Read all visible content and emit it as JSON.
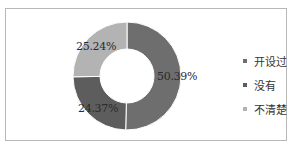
{
  "chart_data": {
    "type": "pie",
    "variant": "donut",
    "title": "",
    "categories": [
      "开设过",
      "没有",
      "不清楚"
    ],
    "values": [
      50.39,
      24.37,
      25.24
    ],
    "value_labels": [
      "50.39%",
      "24.37%",
      "25.24%"
    ],
    "colors": [
      "#6e6e6e",
      "#5d5d5d",
      "#b3b3b3"
    ],
    "legend_position": "right",
    "start_angle": "12 o'clock, clockwise"
  },
  "legend": {
    "items": [
      {
        "label": "开设过",
        "color": "#6e6e6e"
      },
      {
        "label": "没有",
        "color": "#5d5d5d"
      },
      {
        "label": "不清楚",
        "color": "#b3b3b3"
      }
    ]
  }
}
